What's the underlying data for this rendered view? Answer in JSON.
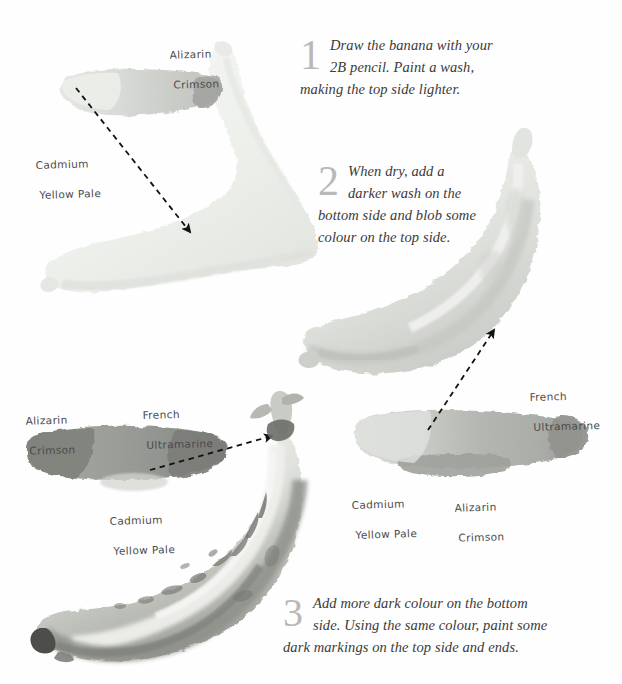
{
  "page": {
    "background_color": "#ffffff",
    "ink_color": "#3a3a3a",
    "step_number_color": "#b9b9b9"
  },
  "steps": [
    {
      "number": "1",
      "line1": "Draw the banana with your",
      "line2": "2B pencil. Paint a wash,",
      "line3": "making the top side lighter."
    },
    {
      "number": "2",
      "line1": "When dry, add a",
      "line2": "darker wash on the",
      "line3": "bottom side and blob some",
      "line4": "colour on the top side."
    },
    {
      "number": "3",
      "line1": "Add more dark colour on the bottom",
      "line2": "side. Using the same colour, paint some",
      "line3": "dark markings on the top side and ends."
    }
  ],
  "pigment_labels": [
    {
      "id": "alizarin-1",
      "line1": "Alizarin",
      "line2": "Crimson"
    },
    {
      "id": "cadmium-1",
      "line1": "Cadmium",
      "line2": "Yellow Pale"
    },
    {
      "id": "alizarin-2",
      "line1": "Alizarin",
      "line2": "Crimson"
    },
    {
      "id": "french-1",
      "line1": "French",
      "line2": "Ultramarine"
    },
    {
      "id": "cadmium-2",
      "line1": "Cadmium",
      "line2": "Yellow Pale"
    },
    {
      "id": "french-2",
      "line1": "French",
      "line2": "Ultramarine"
    },
    {
      "id": "cadmium-3",
      "line1": "Cadmium",
      "line2": "Yellow Pale"
    },
    {
      "id": "alizarin-3",
      "line1": "Alizarin",
      "line2": "Crimson"
    }
  ],
  "swatches": [
    {
      "id": "swatch-step1",
      "pigments": [
        "Cadmium Yellow Pale",
        "Alizarin Crimson"
      ],
      "tone_light": "#e2e3e1",
      "tone_mid": "#cfd1cd",
      "tone_dark": "#a9aaa6"
    },
    {
      "id": "swatch-step3-left",
      "pigments": [
        "Alizarin Crimson",
        "French Ultramarine",
        "Cadmium Yellow Pale"
      ],
      "tone_light": "#b8b9b6",
      "tone_mid": "#9c9d9a",
      "tone_dark": "#7e7f7c"
    },
    {
      "id": "swatch-step2-right",
      "pigments": [
        "Cadmium Yellow Pale",
        "Alizarin Crimson",
        "French Ultramarine"
      ],
      "tone_light": "#d4d5d1",
      "tone_mid": "#b5b6b2",
      "tone_dark": "#8f908c"
    }
  ],
  "bananas": [
    {
      "id": "banana-step1",
      "stage": "pale first wash",
      "tone_light": "#f4f5f3",
      "tone_mid": "#ebece9",
      "tone_dark": "#e0e2de"
    },
    {
      "id": "banana-step2",
      "stage": "darker wash on bottom side",
      "tone_light": "#eef0ec",
      "tone_mid": "#dcdeda",
      "tone_dark": "#c4c6c1"
    },
    {
      "id": "banana-step3",
      "stage": "dark markings and ends",
      "tone_light": "#eceee9",
      "tone_mid": "#c3c5bf",
      "tone_dark": "#8d8f89",
      "marking_color": "#6f716b",
      "tip_color": "#4a4b47"
    }
  ],
  "arrows": [
    {
      "id": "arrow-swatch1-to-banana1",
      "style": "dashed",
      "head": "solid-triangle"
    },
    {
      "id": "arrow-swatch3-to-banana2",
      "style": "dashed",
      "head": "solid-triangle"
    },
    {
      "id": "arrow-swatch2-to-banana3",
      "style": "dashed",
      "head": "solid-triangle"
    }
  ]
}
